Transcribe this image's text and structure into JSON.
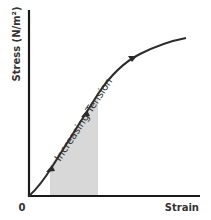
{
  "diagram": {
    "y_axis_label": "Stress (N/m²)",
    "x_axis_label": "Strain",
    "origin_label": "0",
    "curve_label": "Increasing Tension",
    "colors": {
      "axis": "#1a1a1a",
      "curve": "#2b2b2b",
      "shaded_region": "#d4d4d4",
      "text": "#333333"
    },
    "shaded_region": {
      "x_start_px": 50,
      "x_end_px": 98,
      "description": "linear elastic region under curve"
    },
    "arrows": 3
  }
}
